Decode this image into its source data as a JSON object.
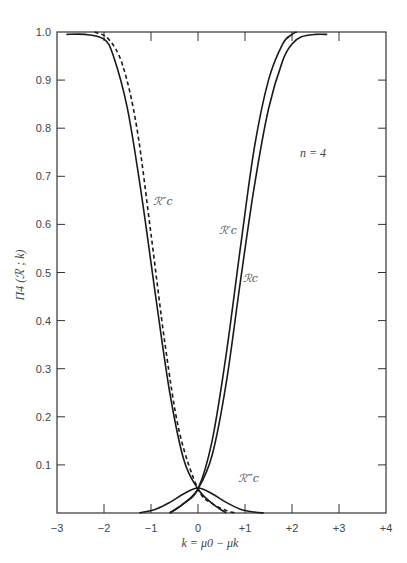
{
  "chart_data": {
    "type": "line",
    "title": "",
    "xlabel": "k = μ0 − μk",
    "ylabel": "Π4 (ℛ ; k)",
    "annotation": "n = 4",
    "xlim": [
      -3,
      4
    ],
    "ylim": [
      0,
      1.0
    ],
    "x_ticks": [
      "−3",
      "−2",
      "−1",
      "0",
      "+1",
      "+2",
      "+3",
      "+4"
    ],
    "y_ticks": [
      "0.1",
      "0.2",
      "0.3",
      "0.4",
      "0.5",
      "0.6",
      "0.7",
      "0.8",
      "0.9",
      "1.0"
    ],
    "grid": false,
    "series": [
      {
        "name": "ℛc",
        "style": "solid",
        "x": [
          -0.6,
          -0.3,
          0,
          0.3,
          0.6,
          0.9,
          1.2,
          1.5,
          1.8,
          2.0,
          2.2,
          2.5,
          2.75
        ],
        "y": [
          0.0,
          0.02,
          0.05,
          0.12,
          0.27,
          0.48,
          0.68,
          0.84,
          0.94,
          0.975,
          0.99,
          0.995,
          0.995
        ]
      },
      {
        "name": "ℛ′c",
        "style": "solid",
        "x": [
          -0.6,
          -0.3,
          0,
          0.3,
          0.6,
          0.9,
          1.2,
          1.5,
          1.8,
          2.0,
          2.1
        ],
        "y": [
          0.0,
          0.02,
          0.05,
          0.15,
          0.33,
          0.55,
          0.76,
          0.9,
          0.975,
          0.995,
          1.0
        ]
      },
      {
        "name": "ℛ″c",
        "style": "dashed",
        "x": [
          -2.2,
          -1.9,
          -1.6,
          -1.3,
          -1.0,
          -0.7,
          -0.4,
          0,
          0.3,
          0.6,
          0.8
        ],
        "y": [
          1.0,
          0.985,
          0.93,
          0.8,
          0.58,
          0.35,
          0.17,
          0.05,
          0.02,
          0.005,
          0.0
        ]
      },
      {
        "name": "left solid (mirror of ℛc)",
        "style": "solid",
        "x": [
          -2.8,
          -2.4,
          -2.0,
          -1.8,
          -1.5,
          -1.2,
          -0.9,
          -0.6,
          -0.3,
          0,
          0.3,
          0.6
        ],
        "y": [
          0.995,
          0.995,
          0.985,
          0.95,
          0.84,
          0.66,
          0.45,
          0.25,
          0.11,
          0.05,
          0.02,
          0.0
        ]
      },
      {
        "name": "ℛ‴c",
        "style": "solid",
        "x": [
          -1.25,
          -0.9,
          -0.6,
          -0.3,
          0,
          0.3,
          0.6,
          0.9,
          1.2,
          1.4
        ],
        "y": [
          0.0,
          0.008,
          0.022,
          0.04,
          0.052,
          0.04,
          0.022,
          0.008,
          0.002,
          0.0
        ]
      }
    ],
    "curve_labels": [
      {
        "text": "ℛ″c",
        "x": -0.95,
        "y": 0.64
      },
      {
        "text": "ℛ′c",
        "x": 0.45,
        "y": 0.58
      },
      {
        "text": "ℛc",
        "x": 0.95,
        "y": 0.48
      },
      {
        "text": "ℛ‴c",
        "x": 0.85,
        "y": 0.065
      }
    ]
  }
}
